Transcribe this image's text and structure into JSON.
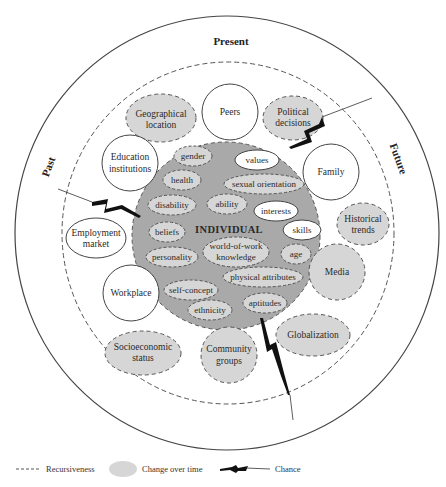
{
  "colors": {
    "change_fill": "#d6d6d6",
    "individual_fill": "#a9a9a9",
    "stroke": "#444444",
    "background": "#ffffff"
  },
  "eras": {
    "present": "Present",
    "past": "Past",
    "future": "Future"
  },
  "individual": {
    "label": "INDIVIDUAL",
    "influences": [
      {
        "label": "gender",
        "type": "change"
      },
      {
        "label": "values",
        "type": "stable"
      },
      {
        "label": "health",
        "type": "change"
      },
      {
        "label": "sexual orientation",
        "type": "change"
      },
      {
        "label": "disability",
        "type": "change"
      },
      {
        "label": "ability",
        "type": "change"
      },
      {
        "label": "interests",
        "type": "stable"
      },
      {
        "label": "beliefs",
        "type": "change"
      },
      {
        "label": "skills",
        "type": "stable"
      },
      {
        "label": "world-of-work",
        "label2": "knowledge",
        "type": "change"
      },
      {
        "label": "personality",
        "type": "change"
      },
      {
        "label": "age",
        "type": "change"
      },
      {
        "label": "physical attributes",
        "type": "change"
      },
      {
        "label": "self-concept",
        "type": "change"
      },
      {
        "label": "aptitudes",
        "type": "change"
      },
      {
        "label": "ethnicity",
        "type": "change"
      }
    ]
  },
  "contextual_system": [
    {
      "label": "Geographical",
      "label2": "location",
      "type": "change"
    },
    {
      "label": "Peers",
      "type": "stable"
    },
    {
      "label": "Political",
      "label2": "decisions",
      "type": "change"
    },
    {
      "label": "Education",
      "label2": "institutions",
      "type": "stable"
    },
    {
      "label": "Family",
      "type": "stable"
    },
    {
      "label": "Historical",
      "label2": "trends",
      "type": "change"
    },
    {
      "label": "Employment",
      "label2": "market",
      "type": "stable"
    },
    {
      "label": "Media",
      "type": "change"
    },
    {
      "label": "Workplace",
      "type": "stable"
    },
    {
      "label": "Globalization",
      "type": "change"
    },
    {
      "label": "Socioeconomic",
      "label2": "status",
      "type": "change"
    },
    {
      "label": "Community",
      "label2": "groups",
      "type": "change"
    }
  ],
  "legend": {
    "recursiveness": "Recursiveness",
    "change_over_time": "Change over time",
    "chance": "Chance"
  }
}
